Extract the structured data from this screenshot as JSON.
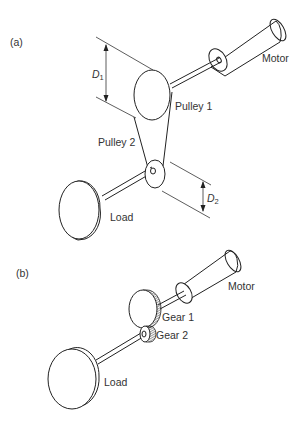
{
  "figure": {
    "panel_a": {
      "label": "(a)",
      "motor_label": "Motor",
      "pulley1_label": "Pulley 1",
      "pulley2_label": "Pulley 2",
      "load_label": "Load",
      "d1_label": "D",
      "d1_sub": "1",
      "d2_label": "D",
      "d2_sub": "2"
    },
    "panel_b": {
      "label": "(b)",
      "motor_label": "Motor",
      "gear1_label": "Gear 1",
      "gear2_label": "Gear 2",
      "load_label": "Load"
    }
  }
}
